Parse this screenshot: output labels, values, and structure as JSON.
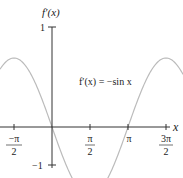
{
  "chart_data": {
    "type": "line",
    "title": "",
    "xlabel": "x",
    "ylabel": "f'(x)",
    "annotation": "f'(x) = −sin x",
    "x_ticks": [
      "−π/2",
      "π/2",
      "π",
      "3π/2"
    ],
    "y_ticks": [
      "1",
      "−1"
    ],
    "xlim": [
      -1.9,
      5.3
    ],
    "ylim": [
      -1,
      1
    ],
    "series": [
      {
        "name": "f'(x) = −sin x",
        "function": "-sin(x)",
        "color": "#bbbbbb"
      }
    ]
  },
  "labels": {
    "ylabel_text": "f′(x)",
    "xlabel_text": "x",
    "annotation_text": "f′(x) = −sin x",
    "y_one": "1",
    "y_neg_one": "−1",
    "x_neg_pi_half_num": "−π",
    "x_neg_pi_half_den": "2",
    "x_pi_half_num": "π",
    "x_pi_half_den": "2",
    "x_pi": "π",
    "x_three_pi_half_num": "3π",
    "x_three_pi_half_den": "2"
  }
}
